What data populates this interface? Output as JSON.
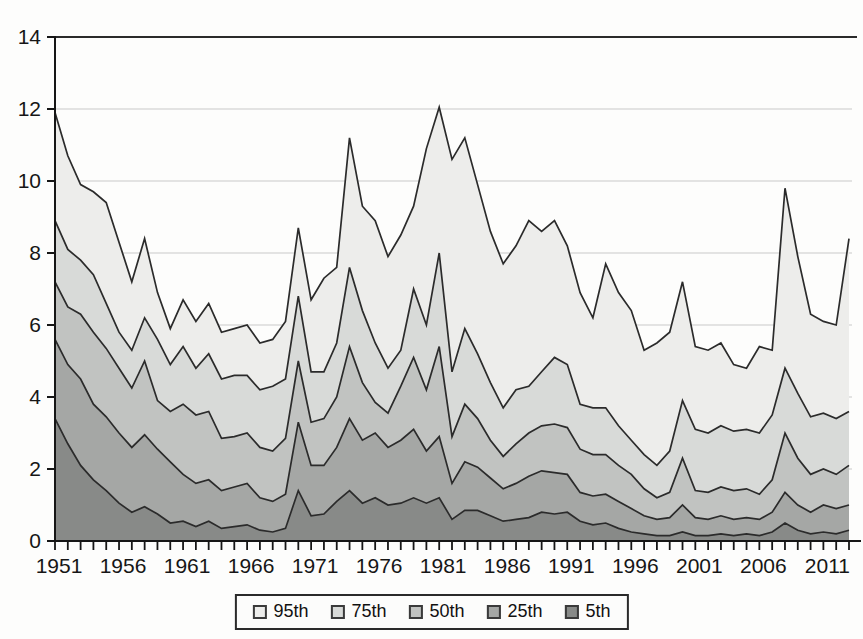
{
  "chart_data": {
    "type": "area",
    "x": [
      1951,
      1952,
      1953,
      1954,
      1955,
      1956,
      1957,
      1958,
      1959,
      1960,
      1961,
      1962,
      1963,
      1964,
      1965,
      1966,
      1967,
      1968,
      1969,
      1970,
      1971,
      1972,
      1973,
      1974,
      1975,
      1976,
      1977,
      1978,
      1979,
      1980,
      1981,
      1982,
      1983,
      1984,
      1985,
      1986,
      1987,
      1988,
      1989,
      1990,
      1991,
      1992,
      1993,
      1994,
      1995,
      1996,
      1997,
      1998,
      1999,
      2000,
      2001,
      2002,
      2003,
      2004,
      2005,
      2006,
      2007,
      2008,
      2009,
      2010,
      2011,
      2012,
      2013
    ],
    "series": [
      {
        "name": "95th",
        "label": "95th",
        "color": "#ededeb",
        "values": [
          11.9,
          10.7,
          9.9,
          9.7,
          9.4,
          8.3,
          7.2,
          8.4,
          6.9,
          5.9,
          6.7,
          6.1,
          6.6,
          5.8,
          5.9,
          6.0,
          5.5,
          5.6,
          6.1,
          8.7,
          6.7,
          7.3,
          7.6,
          11.2,
          9.3,
          8.9,
          7.9,
          8.5,
          9.3,
          10.9,
          12.05,
          10.6,
          11.2,
          9.9,
          8.6,
          7.7,
          8.2,
          8.9,
          8.6,
          8.9,
          8.2,
          6.9,
          6.2,
          7.7,
          6.9,
          6.4,
          5.3,
          5.5,
          5.8,
          7.2,
          5.4,
          5.3,
          5.5,
          4.9,
          4.8,
          5.4,
          5.3,
          9.8,
          7.9,
          6.3,
          6.1,
          6.0,
          8.4
        ]
      },
      {
        "name": "75th",
        "label": "75th",
        "color": "#d8dad8",
        "values": [
          8.9,
          8.1,
          7.8,
          7.4,
          6.6,
          5.8,
          5.3,
          6.2,
          5.6,
          4.9,
          5.4,
          4.8,
          5.2,
          4.5,
          4.6,
          4.6,
          4.2,
          4.3,
          4.5,
          6.8,
          4.7,
          4.7,
          5.5,
          7.6,
          6.4,
          5.5,
          4.8,
          5.3,
          7.0,
          6.0,
          8.0,
          4.7,
          5.9,
          5.2,
          4.4,
          3.7,
          4.2,
          4.3,
          4.7,
          5.1,
          4.9,
          3.8,
          3.7,
          3.7,
          3.2,
          2.8,
          2.4,
          2.1,
          2.5,
          3.9,
          3.1,
          3.0,
          3.2,
          3.05,
          3.1,
          3.0,
          3.5,
          4.8,
          4.1,
          3.45,
          3.55,
          3.4,
          3.6
        ]
      },
      {
        "name": "50th",
        "label": "50th",
        "color": "#c1c3c1",
        "values": [
          7.2,
          6.5,
          6.3,
          5.8,
          5.35,
          4.8,
          4.25,
          5.0,
          3.9,
          3.6,
          3.8,
          3.5,
          3.6,
          2.85,
          2.9,
          3.0,
          2.6,
          2.5,
          2.85,
          5.0,
          3.3,
          3.4,
          4.0,
          5.4,
          4.4,
          3.85,
          3.55,
          4.3,
          5.1,
          4.2,
          5.4,
          2.9,
          3.8,
          3.4,
          2.8,
          2.35,
          2.7,
          3.0,
          3.2,
          3.25,
          3.15,
          2.55,
          2.4,
          2.4,
          2.1,
          1.85,
          1.45,
          1.2,
          1.35,
          2.3,
          1.4,
          1.35,
          1.5,
          1.4,
          1.45,
          1.3,
          1.7,
          3.0,
          2.3,
          1.85,
          2.0,
          1.85,
          2.1
        ]
      },
      {
        "name": "25th",
        "label": "25th",
        "color": "#a5a7a5",
        "values": [
          5.6,
          4.9,
          4.5,
          3.8,
          3.45,
          3.0,
          2.6,
          2.95,
          2.55,
          2.2,
          1.85,
          1.6,
          1.7,
          1.4,
          1.5,
          1.6,
          1.2,
          1.1,
          1.3,
          3.3,
          2.1,
          2.1,
          2.6,
          3.4,
          2.8,
          3.0,
          2.6,
          2.8,
          3.1,
          2.5,
          2.9,
          1.6,
          2.2,
          2.05,
          1.75,
          1.45,
          1.6,
          1.8,
          1.95,
          1.9,
          1.85,
          1.35,
          1.25,
          1.3,
          1.1,
          0.9,
          0.7,
          0.6,
          0.65,
          1.0,
          0.65,
          0.6,
          0.7,
          0.6,
          0.65,
          0.6,
          0.8,
          1.35,
          1.0,
          0.8,
          1.0,
          0.9,
          1.0
        ]
      },
      {
        "name": "5th",
        "label": "5th",
        "color": "#888a88",
        "values": [
          3.4,
          2.7,
          2.1,
          1.7,
          1.4,
          1.05,
          0.8,
          0.95,
          0.75,
          0.5,
          0.55,
          0.4,
          0.55,
          0.35,
          0.4,
          0.45,
          0.3,
          0.25,
          0.35,
          1.4,
          0.7,
          0.75,
          1.1,
          1.4,
          1.05,
          1.2,
          1.0,
          1.05,
          1.2,
          1.05,
          1.2,
          0.6,
          0.85,
          0.85,
          0.7,
          0.55,
          0.6,
          0.65,
          0.8,
          0.75,
          0.8,
          0.55,
          0.45,
          0.5,
          0.35,
          0.25,
          0.2,
          0.15,
          0.15,
          0.25,
          0.15,
          0.15,
          0.2,
          0.15,
          0.2,
          0.15,
          0.25,
          0.5,
          0.3,
          0.2,
          0.25,
          0.2,
          0.3
        ]
      }
    ],
    "title": "",
    "xlabel": "",
    "ylabel": "",
    "ylim": [
      0,
      14
    ],
    "y_ticks": [
      0,
      2,
      4,
      6,
      8,
      10,
      12,
      14
    ],
    "x_tick_labels": [
      "1951",
      "1956",
      "1961",
      "1966",
      "1971",
      "1976",
      "1981",
      "1986",
      "1991",
      "1996",
      "2001",
      "2006",
      "2011"
    ],
    "x_tick_label_years": [
      1951,
      1956,
      1961,
      1966,
      1971,
      1976,
      1981,
      1986,
      1991,
      1996,
      2001,
      2006,
      2011
    ],
    "x_minor_tick_first_year": 1951,
    "x_minor_tick_last_year": 2014,
    "grid": "horizontal",
    "legend_position": "bottom-center",
    "line_color": "#2b2b2b",
    "grid_color": "#c9c9c9",
    "axis_color": "#161616"
  },
  "legend": {
    "items": [
      "95th",
      "75th",
      "50th",
      "25th",
      "5th"
    ]
  }
}
